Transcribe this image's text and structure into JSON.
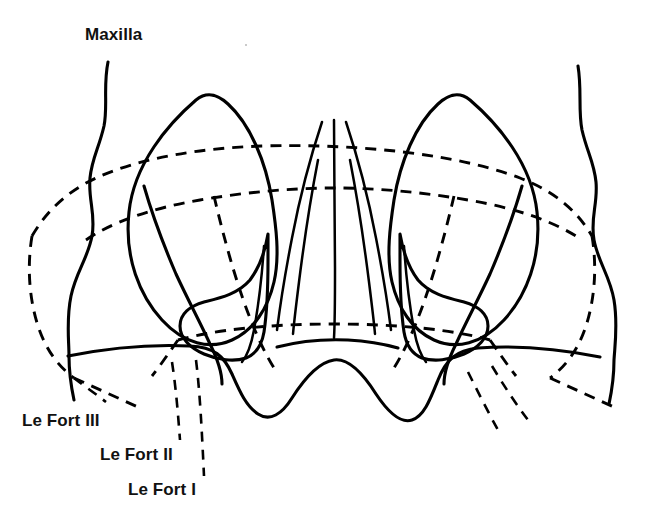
{
  "figure": {
    "type": "anatomical-line-diagram",
    "background_color": "#ffffff",
    "line_color": "#000000",
    "solid_line_meaning": "bone outline",
    "dashed_line_meaning": "fracture line"
  },
  "labels": {
    "maxilla": "Maxilla",
    "le_fort_3": "Le Fort III",
    "le_fort_2": "Le Fort II",
    "le_fort_1": "Le Fort I"
  },
  "caption": {
    "cut_off_text": ""
  },
  "structures": {
    "orbit_left": "left orbital rim",
    "orbit_right": "right orbital rim",
    "nasal_aperture": "piriform nasal aperture",
    "nasal_septum": "nasal septum midline",
    "turbinate_left": "left inferior turbinate",
    "turbinate_right": "right inferior turbinate",
    "zygoma_left": "left zygomatic process",
    "zygoma_right": "right zygomatic process",
    "alveolar_arch": "maxillary alveolar arch",
    "temporal_left": "left lateral skull contour",
    "temporal_right": "right lateral skull contour"
  },
  "fracture_levels": [
    {
      "name": "Le Fort I",
      "description": "horizontal fracture above the alveolar arch, crossing the lower nasal aperture"
    },
    {
      "name": "Le Fort II",
      "description": "pyramidal fracture through the nasal bridge, medial orbital walls and maxilla"
    },
    {
      "name": "Le Fort III",
      "description": "craniofacial dysjunction across the orbits and zygomatic arches"
    }
  ]
}
